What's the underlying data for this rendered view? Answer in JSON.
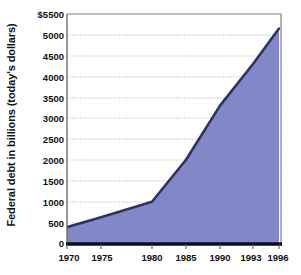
{
  "chart_data": {
    "type": "area",
    "title": "",
    "subtitle": "",
    "xlabel": "",
    "ylabel": "Federal debt in billions (today's dollars)",
    "x": [
      1970,
      1975,
      1980,
      1985,
      1990,
      1993,
      1996
    ],
    "values": [
      380,
      620,
      990,
      2000,
      3300,
      4300,
      5150
    ],
    "series": [
      {
        "name": "Federal debt",
        "values": [
          380,
          620,
          990,
          2000,
          3300,
          4300,
          5150
        ]
      }
    ],
    "xtick_labels": [
      "1970",
      "1975",
      "1980",
      "1985",
      "1990",
      "1993",
      "1996"
    ],
    "ytick_labels": [
      "0",
      "500",
      "1000",
      "1500",
      "2000",
      "2500",
      "3000",
      "3500",
      "4000",
      "4500",
      "5000",
      "$5500"
    ],
    "ytick_values": [
      0,
      500,
      1000,
      1500,
      2000,
      2500,
      3000,
      3500,
      4000,
      4500,
      5000,
      5500
    ],
    "ylim": [
      0,
      5500
    ],
    "xlim": [
      1970,
      1996
    ],
    "grid": "horizontal-dotted",
    "legend": "none",
    "colors": {
      "area_fill": "#8187c7",
      "area_line": "#2b3171",
      "baseline": "#0d0d16",
      "gridline": "#9a9a9a",
      "axis_frame": "#808080",
      "text": "#111111",
      "background": "#ffffff"
    }
  }
}
